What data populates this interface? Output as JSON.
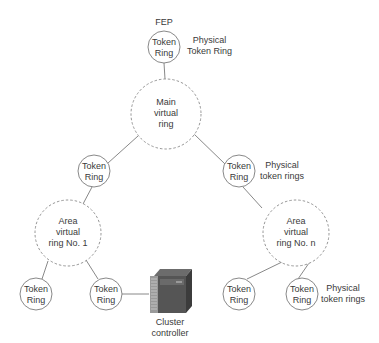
{
  "diagram": {
    "top": {
      "label": "FEP",
      "node": "Token\nRing",
      "annotation": "Physical\nToken Ring"
    },
    "main_virtual_ring": "Main\nvirtual\nring",
    "mid_left_ring": "Token\nRing",
    "mid_right_ring": "Token\nRing",
    "mid_right_annotation": "Physical\ntoken rings",
    "area_ring_1": "Area\nvirtual\nring No. 1",
    "area_ring_n": "Area\nvirtual\nring No. n",
    "bottom_rings": [
      "Token\nRing",
      "Token\nRing",
      "Token\nRing",
      "Token\nRing"
    ],
    "bottom_right_annotation": "Physical\ntoken rings",
    "cluster_controller": "Cluster\ncontroller"
  },
  "colors": {
    "line": "#7a7a7a",
    "dashed": "#8a8a8a",
    "text": "#3a3a3a"
  }
}
